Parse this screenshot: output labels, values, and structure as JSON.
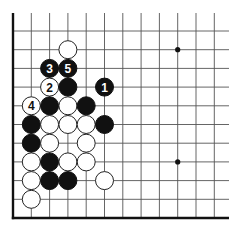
{
  "diagram": {
    "type": "go-board-fragment",
    "grid": {
      "columns_x": [
        13,
        31.3,
        49.6,
        67.9,
        86.2,
        104.5,
        122.8,
        141.1,
        159.4,
        177.7,
        196,
        214.3
      ],
      "rows_y": [
        31,
        49.7,
        68.4,
        87.1,
        105.8,
        124.5,
        143.2,
        161.9,
        180.6,
        199.3,
        218
      ],
      "top_y": 13,
      "right_x": 229,
      "left_edge_x": 13,
      "bottom_edge_y": 218
    },
    "star_points": [
      {
        "col": 9,
        "row": 1
      },
      {
        "col": 9,
        "row": 7
      }
    ],
    "stones": [
      {
        "color": "white",
        "col": 3,
        "row": 1,
        "label": ""
      },
      {
        "color": "black",
        "col": 2,
        "row": 2,
        "label": "3"
      },
      {
        "color": "black",
        "col": 3,
        "row": 2,
        "label": "5"
      },
      {
        "color": "white",
        "col": 2,
        "row": 3,
        "label": "2"
      },
      {
        "color": "black",
        "col": 3,
        "row": 3,
        "label": ""
      },
      {
        "color": "black",
        "col": 5,
        "row": 3,
        "label": "1"
      },
      {
        "color": "white",
        "col": 1,
        "row": 4,
        "label": "4"
      },
      {
        "color": "black",
        "col": 2,
        "row": 4,
        "label": ""
      },
      {
        "color": "white",
        "col": 3,
        "row": 4,
        "label": ""
      },
      {
        "color": "black",
        "col": 4,
        "row": 4,
        "label": ""
      },
      {
        "color": "black",
        "col": 1,
        "row": 5,
        "label": ""
      },
      {
        "color": "white",
        "col": 2,
        "row": 5,
        "label": ""
      },
      {
        "color": "white",
        "col": 3,
        "row": 5,
        "label": ""
      },
      {
        "color": "white",
        "col": 4,
        "row": 5,
        "label": ""
      },
      {
        "color": "black",
        "col": 5,
        "row": 5,
        "label": ""
      },
      {
        "color": "black",
        "col": 1,
        "row": 6,
        "label": ""
      },
      {
        "color": "white",
        "col": 2,
        "row": 6,
        "label": ""
      },
      {
        "color": "white",
        "col": 4,
        "row": 6,
        "label": ""
      },
      {
        "color": "white",
        "col": 1,
        "row": 7,
        "label": ""
      },
      {
        "color": "black",
        "col": 2,
        "row": 7,
        "label": ""
      },
      {
        "color": "white",
        "col": 3,
        "row": 7,
        "label": ""
      },
      {
        "color": "white",
        "col": 4,
        "row": 7,
        "label": ""
      },
      {
        "color": "white",
        "col": 1,
        "row": 8,
        "label": ""
      },
      {
        "color": "black",
        "col": 2,
        "row": 8,
        "label": ""
      },
      {
        "color": "black",
        "col": 3,
        "row": 8,
        "label": ""
      },
      {
        "color": "white",
        "col": 5,
        "row": 8,
        "label": ""
      },
      {
        "color": "white",
        "col": 1,
        "row": 9,
        "label": ""
      }
    ],
    "colors": {
      "black_stone": "#111111",
      "white_stone": "#ffffff",
      "grid": "#555555",
      "background": "#ffffff"
    }
  }
}
